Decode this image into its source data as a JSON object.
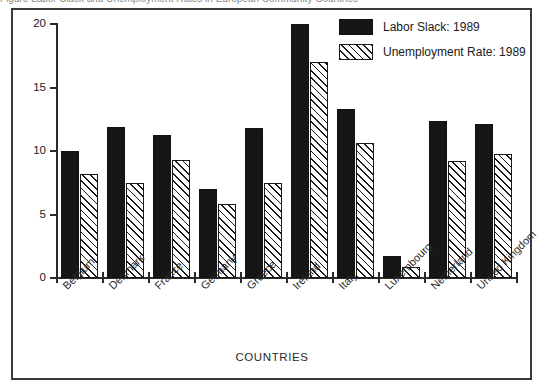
{
  "caption_fragment": "Figure  Labor Slack and Unemployment Rates in European Community Countries",
  "chart_data": {
    "type": "bar",
    "title": "",
    "xlabel": "COUNTRIES",
    "ylabel": "",
    "ylim": [
      0,
      20
    ],
    "yticks": [
      "0",
      "5",
      "10",
      "15",
      "20"
    ],
    "ytick_values": [
      0,
      5,
      10,
      15,
      20
    ],
    "grid": false,
    "legend_position": "top-right",
    "categories": [
      "Belgium",
      "Denmark",
      "France",
      "Germany",
      "Greece",
      "Ireland",
      "Italy",
      "Luxembourg",
      "Netherland",
      "United Kingdom"
    ],
    "series": [
      {
        "name": "Labor Slack: 1989",
        "fill": "solid-black",
        "color": "#161616",
        "values": [
          10.0,
          11.9,
          11.3,
          7.0,
          11.8,
          20.0,
          13.3,
          1.7,
          12.4,
          12.1
        ]
      },
      {
        "name": "Unemployment Rate: 1989",
        "fill": "diagonal-hatch",
        "color": "#ffffff",
        "values": [
          8.2,
          7.5,
          9.3,
          5.8,
          7.5,
          17.0,
          10.6,
          0.9,
          9.2,
          9.8
        ]
      }
    ]
  }
}
